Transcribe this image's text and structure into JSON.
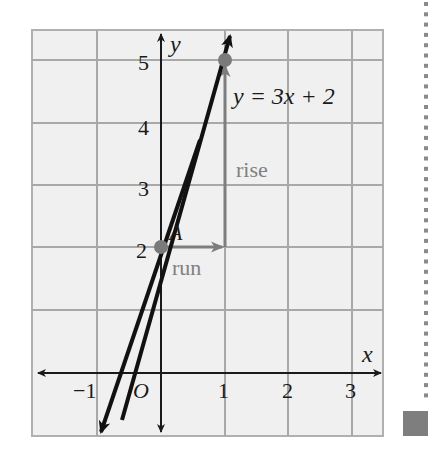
{
  "figure": {
    "type": "coordinate-graph",
    "equation_label": "y = 3x + 2",
    "axis_labels": {
      "x": "x",
      "y": "y"
    },
    "origin_label": "O",
    "x_ticks": [
      "−1",
      "1",
      "2",
      "3"
    ],
    "y_ticks": [
      "2",
      "3",
      "4",
      "5"
    ],
    "point_A_label": "A",
    "rise_label": "rise",
    "run_label": "run",
    "points": [
      {
        "name": "A",
        "x": 0,
        "y": 2
      },
      {
        "name": "B",
        "x": 1,
        "y": 5
      }
    ],
    "line": {
      "slope": 3,
      "intercept": 2
    },
    "x_range": [
      -2,
      3.5
    ],
    "y_range": [
      -1,
      5.5
    ],
    "colors": {
      "grid_bg": "#f0f0f0",
      "grid_line": "#a8a8a8",
      "axis": "#1a1a1a",
      "line": "#111111",
      "point": "#7a7a7a",
      "annotation": "#808080",
      "sidebar_marker": "#808080"
    }
  },
  "chart_data": {
    "type": "line",
    "title": "y = 3x + 2",
    "xlabel": "x",
    "ylabel": "y",
    "x": [
      -1,
      0,
      1
    ],
    "series": [
      {
        "name": "y = 3x + 2",
        "values": [
          -1,
          2,
          5
        ]
      }
    ],
    "highlighted_points": [
      [
        0,
        2
      ],
      [
        1,
        5
      ]
    ],
    "annotations": [
      "A",
      "rise",
      "run",
      "O"
    ],
    "xticks": [
      -1,
      1,
      2,
      3
    ],
    "yticks": [
      2,
      3,
      4,
      5
    ],
    "xlim": [
      -2,
      3.5
    ],
    "ylim": [
      -1,
      5.5
    ],
    "grid": true
  }
}
